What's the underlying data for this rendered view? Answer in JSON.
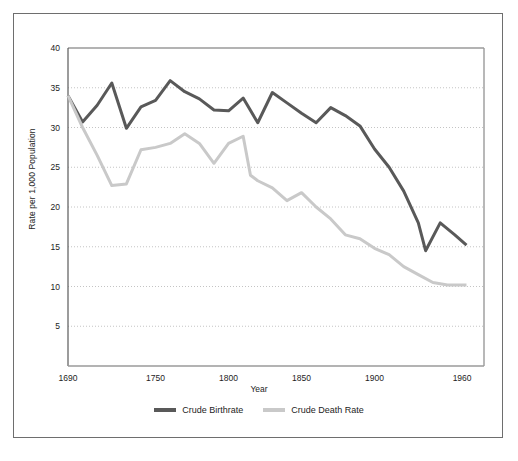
{
  "figure": {
    "border_color": "#6e6e6e",
    "background": "#ffffff"
  },
  "axes": {
    "x_title": "Year",
    "y_title": "Rate per 1,000 Population",
    "x_ticks": [
      "1690",
      "1750",
      "1800",
      "1850",
      "1900",
      "1960"
    ],
    "y_ticks": [
      "40",
      "35",
      "30",
      "25",
      "20",
      "15",
      "10",
      "5"
    ]
  },
  "legend": {
    "items": [
      {
        "label": "Crude Birthrate",
        "color": "#595959"
      },
      {
        "label": "Crude Death Rate",
        "color": "#c9c9c9"
      }
    ]
  },
  "chart_data": {
    "type": "line",
    "title": "",
    "xlabel": "Year",
    "ylabel": "Rate per 1,000 Population",
    "xlim": [
      1690,
      1975
    ],
    "ylim": [
      0,
      40
    ],
    "yticks": [
      5,
      10,
      15,
      20,
      25,
      30,
      35,
      40
    ],
    "xticks": [
      1690,
      1750,
      1800,
      1850,
      1900,
      1960
    ],
    "grid": "horizontal-dotted",
    "legend_position": "bottom-center",
    "series": [
      {
        "name": "Crude Birthrate",
        "color": "#595959",
        "x": [
          1690,
          1700,
          1710,
          1720,
          1730,
          1740,
          1750,
          1760,
          1770,
          1780,
          1790,
          1800,
          1810,
          1820,
          1830,
          1840,
          1850,
          1860,
          1870,
          1880,
          1890,
          1900,
          1910,
          1920,
          1930,
          1935,
          1945,
          1955,
          1963
        ],
        "y": [
          34.0,
          30.7,
          32.8,
          35.6,
          29.9,
          32.6,
          33.4,
          35.9,
          34.5,
          33.6,
          32.2,
          32.1,
          33.7,
          30.6,
          34.4,
          33.1,
          31.8,
          30.6,
          32.5,
          31.5,
          30.2,
          27.3,
          25.0,
          22.0,
          18.0,
          14.5,
          18.0,
          16.5,
          15.2
        ]
      },
      {
        "name": "Crude Death Rate",
        "color": "#c9c9c9",
        "x": [
          1690,
          1700,
          1710,
          1720,
          1730,
          1740,
          1750,
          1760,
          1770,
          1780,
          1790,
          1800,
          1810,
          1815,
          1820,
          1830,
          1840,
          1850,
          1860,
          1870,
          1880,
          1890,
          1900,
          1910,
          1920,
          1930,
          1940,
          1950,
          1963
        ],
        "y": [
          34.0,
          30.0,
          26.5,
          22.7,
          22.9,
          27.2,
          27.5,
          28.0,
          29.2,
          28.0,
          25.5,
          28.0,
          28.9,
          24.0,
          23.3,
          22.4,
          20.8,
          21.8,
          20.0,
          18.5,
          16.5,
          16.0,
          14.8,
          14.0,
          12.5,
          11.5,
          10.5,
          10.2,
          10.2
        ]
      }
    ]
  }
}
